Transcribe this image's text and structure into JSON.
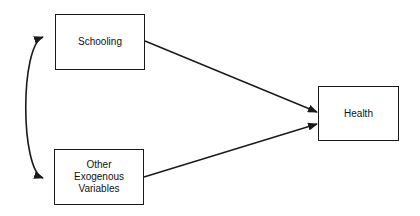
{
  "diagram": {
    "type": "path-diagram",
    "nodes": {
      "schooling": {
        "label": "Schooling"
      },
      "other": {
        "label": "Other\nExogenous\nVariables"
      },
      "health": {
        "label": "Health"
      }
    },
    "edges": [
      {
        "from": "Schooling",
        "to": "Health",
        "kind": "directed"
      },
      {
        "from": "Other Exogenous Variables",
        "to": "Health",
        "kind": "directed"
      },
      {
        "from": "Schooling",
        "to": "Other Exogenous Variables",
        "kind": "bidirectional-curved"
      }
    ],
    "colors": {
      "line": "#1a1a1a",
      "background": "#ffffff"
    }
  }
}
